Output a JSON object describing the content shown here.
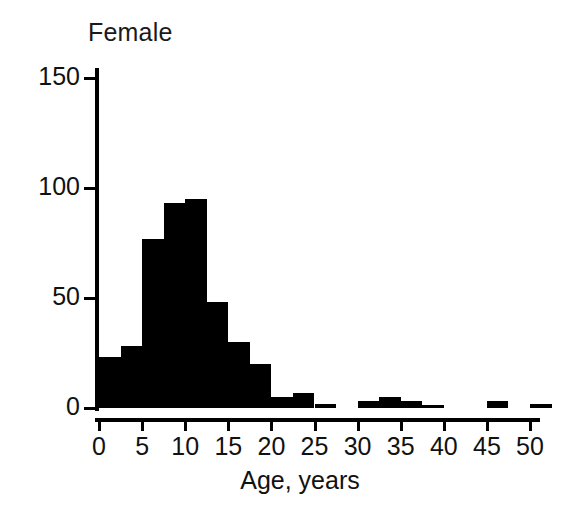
{
  "chart_data": {
    "type": "bar",
    "title": "Female",
    "subtitle": "",
    "xlabel": "Age, years",
    "ylabel": "",
    "xlim": [
      0,
      51.5
    ],
    "ylim": [
      0,
      160
    ],
    "grid": false,
    "legend": null,
    "bin_width": 2.5,
    "x_ticks": [
      0,
      5,
      10,
      15,
      20,
      25,
      30,
      35,
      40,
      45,
      50
    ],
    "x_tick_labels": [
      "0",
      "5",
      "10",
      "15",
      "20",
      "25",
      "30",
      "35",
      "40",
      "45",
      "50"
    ],
    "y_ticks": [
      0,
      50,
      100,
      150
    ],
    "y_tick_labels": [
      "0",
      "50",
      "100",
      "150"
    ],
    "bar_color": "#000000",
    "categories": [
      "0-2.5",
      "2.5-5",
      "5-7.5",
      "7.5-10",
      "10-12.5",
      "12.5-15",
      "15-17.5",
      "17.5-20",
      "20-22.5",
      "22.5-25",
      "25-27.5",
      "27.5-30",
      "30-32.5",
      "32.5-35",
      "35-37.5",
      "37.5-40",
      "40-42.5",
      "42.5-45",
      "45-47.5",
      "47.5-50",
      "50-52.5"
    ],
    "bin_starts": [
      0,
      2.5,
      5,
      7.5,
      10,
      12.5,
      15,
      17.5,
      20,
      22.5,
      25,
      27.5,
      30,
      32.5,
      35,
      37.5,
      40,
      42.5,
      45,
      47.5,
      50
    ],
    "values": [
      23,
      28,
      77,
      93,
      95,
      48,
      30,
      20,
      5,
      7,
      2,
      0,
      3,
      5,
      3,
      1,
      0,
      0,
      3,
      0,
      2
    ]
  },
  "axis": {
    "y_ticks": [
      {
        "label": "150",
        "value": 150
      },
      {
        "label": "100",
        "value": 100
      },
      {
        "label": "50",
        "value": 50
      },
      {
        "label": "0",
        "value": 0
      }
    ],
    "x_ticks": [
      {
        "label": "0",
        "value": 0
      },
      {
        "label": "5",
        "value": 5
      },
      {
        "label": "10",
        "value": 10
      },
      {
        "label": "15",
        "value": 15
      },
      {
        "label": "20",
        "value": 20
      },
      {
        "label": "25",
        "value": 25
      },
      {
        "label": "30",
        "value": 30
      },
      {
        "label": "35",
        "value": 35
      },
      {
        "label": "40",
        "value": 40
      },
      {
        "label": "45",
        "value": 45
      },
      {
        "label": "50",
        "value": 50
      }
    ]
  },
  "colors": {
    "bar": "#000000",
    "axis": "#000000",
    "text": "#111111",
    "background": "#ffffff"
  }
}
